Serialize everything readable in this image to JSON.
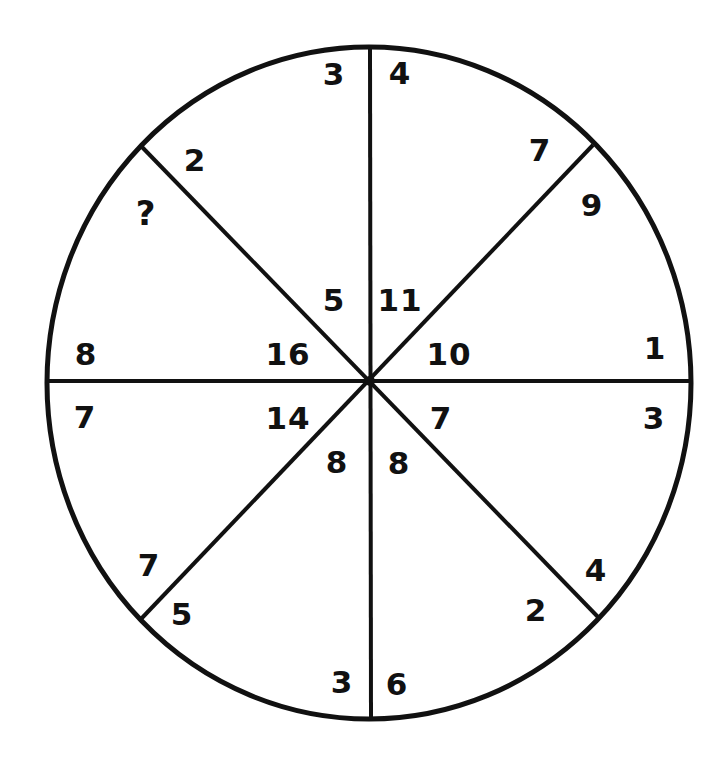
{
  "puzzle": {
    "type": "number-wheel",
    "segments_count": 8,
    "missing_value_symbol": "?",
    "colors": {
      "line": "#111111",
      "text": "#111111",
      "background": "#ffffff"
    },
    "geometry": {
      "center": [
        369,
        381
      ],
      "radius": 322
    },
    "segments": [
      {
        "name": "top-right",
        "outer": "4",
        "inner": "11",
        "outer_pos": [
          401,
          72
        ],
        "inner_pos": [
          403,
          300
        ]
      },
      {
        "name": "right-top",
        "outer_edge_upper": "7",
        "outer_edge_lower": "9",
        "inner": "10"
      },
      {
        "name": "right-bottom",
        "outer": "3",
        "inner": "7"
      },
      {
        "name": "bottom-right",
        "outer_edge_upper": "4",
        "outer_edge_lower": "2",
        "inner": "8"
      },
      {
        "name": "bottom-left",
        "outer": "3",
        "inner": "8"
      },
      {
        "name": "left-bottom",
        "outer_edge_upper": "7",
        "outer_edge_lower": "5",
        "inner": "14"
      },
      {
        "name": "left-top",
        "outer": "8",
        "inner": "16"
      },
      {
        "name": "top-left",
        "outer_edge_upper": "2",
        "outer_edge_lower": "?",
        "inner": "5"
      }
    ],
    "labels": [
      {
        "id": "l01",
        "text": "3",
        "x": 334,
        "y": 74
      },
      {
        "id": "l02",
        "text": "4",
        "x": 400,
        "y": 73
      },
      {
        "id": "l03",
        "text": "7",
        "x": 540,
        "y": 150
      },
      {
        "id": "l04",
        "text": "2",
        "x": 195,
        "y": 160
      },
      {
        "id": "l05",
        "text": "?",
        "x": 146,
        "y": 213
      },
      {
        "id": "l06",
        "text": "9",
        "x": 592,
        "y": 205
      },
      {
        "id": "l07",
        "text": "5",
        "x": 334,
        "y": 300
      },
      {
        "id": "l08",
        "text": "11",
        "x": 400,
        "y": 300
      },
      {
        "id": "l09",
        "text": "8",
        "x": 86,
        "y": 354
      },
      {
        "id": "l10",
        "text": "16",
        "x": 288,
        "y": 354
      },
      {
        "id": "l11",
        "text": "10",
        "x": 449,
        "y": 354
      },
      {
        "id": "l12",
        "text": "1",
        "x": 655,
        "y": 348
      },
      {
        "id": "l13",
        "text": "7",
        "x": 85,
        "y": 417
      },
      {
        "id": "l14",
        "text": "14",
        "x": 288,
        "y": 418
      },
      {
        "id": "l15",
        "text": "7",
        "x": 441,
        "y": 418
      },
      {
        "id": "l16",
        "text": "3",
        "x": 654,
        "y": 418
      },
      {
        "id": "l17",
        "text": "8",
        "x": 337,
        "y": 462
      },
      {
        "id": "l18",
        "text": "8",
        "x": 399,
        "y": 463
      },
      {
        "id": "l19",
        "text": "7",
        "x": 149,
        "y": 565
      },
      {
        "id": "l20",
        "text": "4",
        "x": 596,
        "y": 570
      },
      {
        "id": "l21",
        "text": "5",
        "x": 182,
        "y": 614
      },
      {
        "id": "l22",
        "text": "2",
        "x": 536,
        "y": 610
      },
      {
        "id": "l23",
        "text": "3",
        "x": 342,
        "y": 682
      },
      {
        "id": "l24",
        "text": "6",
        "x": 397,
        "y": 684
      }
    ]
  }
}
